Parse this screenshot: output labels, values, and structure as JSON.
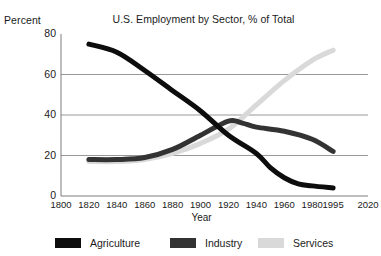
{
  "chart_data": {
    "type": "line",
    "title": "U.S. Employment by Sector, % of Total",
    "xlabel": "Year",
    "ylabel": "Percent",
    "xlim": [
      1800,
      2020
    ],
    "ylim": [
      0,
      80
    ],
    "grid": true,
    "grid_axis": "y",
    "legend_position": "bottom",
    "x_ticks": [
      "1800",
      "1820",
      "1840",
      "1860",
      "1880",
      "1900",
      "1920",
      "1940",
      "1960",
      "1980",
      "1995",
      "2020"
    ],
    "x_tick_values": [
      1800,
      1820,
      1840,
      1860,
      1880,
      1900,
      1920,
      1940,
      1960,
      1980,
      1995,
      2020
    ],
    "y_ticks": [
      "0",
      "20",
      "40",
      "60",
      "80"
    ],
    "y_tick_values": [
      0,
      20,
      40,
      60,
      80
    ],
    "series": [
      {
        "name": "Agriculture",
        "color": "#0d0d0d",
        "x": [
          1820,
          1840,
          1860,
          1880,
          1900,
          1920,
          1940,
          1950,
          1960,
          1970,
          1980,
          1995
        ],
        "values": [
          75,
          71,
          62,
          52,
          42,
          30,
          21,
          14,
          9,
          6,
          5,
          4
        ]
      },
      {
        "name": "Industry",
        "color": "#333333",
        "x": [
          1820,
          1840,
          1860,
          1880,
          1900,
          1920,
          1930,
          1940,
          1960,
          1980,
          1995
        ],
        "values": [
          18,
          18,
          19,
          23,
          30,
          37,
          36,
          34,
          32,
          28,
          22
        ]
      },
      {
        "name": "Services",
        "color": "#d9d9d9",
        "x": [
          1820,
          1840,
          1860,
          1880,
          1900,
          1920,
          1940,
          1960,
          1980,
          1995
        ],
        "values": [
          17,
          17,
          18,
          21,
          26,
          33,
          45,
          57,
          67,
          72
        ]
      }
    ]
  },
  "header": {
    "percent_label": "Percent",
    "title": "U.S. Employment by Sector, % of Total",
    "clipped_top_text": ""
  },
  "axes": {
    "x_label": "Year",
    "y_label": "Percent"
  },
  "legend": {
    "items": [
      {
        "label": "Agriculture",
        "color": "#0d0d0d"
      },
      {
        "label": "Industry",
        "color": "#333333"
      },
      {
        "label": "Services",
        "color": "#d9d9d9"
      }
    ]
  },
  "colors": {
    "agriculture": "#0d0d0d",
    "industry": "#333333",
    "services": "#d9d9d9",
    "gridline": "#8c8c8c",
    "axis": "#6e6e6e",
    "text": "#1a1a1a",
    "background": "#ffffff"
  }
}
